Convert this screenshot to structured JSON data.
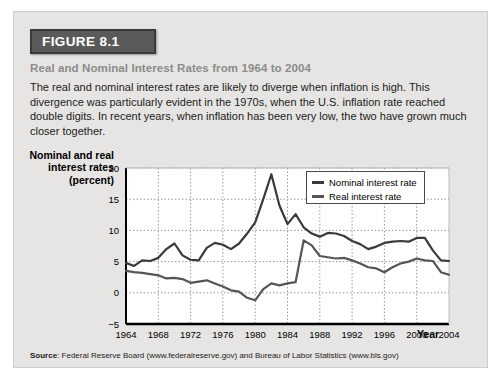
{
  "figure": {
    "badge": "FIGURE 8.1",
    "subtitle": "Real and Nominal Interest Rates from 1964 to 2004",
    "description": "The real and nominal interest rates are likely to diverge when inflation is high. This divergence was particularly evident in the 1970s, when the U.S. inflation rate reached double digits. In recent years, when inflation has been very low, the two have grown much closer together.",
    "source_label": "Source",
    "source_text": ": Federal Reserve Board (www.federalreserve.gov) and Bureau of Labor Statistics (www.bls.gov)"
  },
  "colors": {
    "panel_bg": "#e6e5e3",
    "badge_bg": "#5a5a5a",
    "subtitle": "#8b8b8b",
    "nominal_line": "#3a3a3a",
    "real_line": "#555555",
    "grid": "#9a9a9a"
  },
  "legend": {
    "position": "top-right-inside",
    "items": [
      {
        "label": "Nominal interest rate",
        "color": "#3a3a3a"
      },
      {
        "label": "Real interest rate",
        "color": "#555555"
      }
    ]
  },
  "chart_data": {
    "type": "line",
    "title": "Real and Nominal Interest Rates from 1964 to 2004",
    "xlabel": "Year",
    "ylabel": "Nominal and real interest rates (percent)",
    "xlim": [
      1964,
      2004
    ],
    "ylim": [
      -5,
      20
    ],
    "yticks": [
      -5,
      0,
      5,
      10,
      15,
      20
    ],
    "ytick_labels": [
      "−5",
      "0",
      "5",
      "10",
      "15",
      "20"
    ],
    "xticks": [
      1964,
      1968,
      1972,
      1976,
      1980,
      1984,
      1988,
      1992,
      1996,
      2000,
      2004
    ],
    "xtick_labels": [
      "1964",
      "1968",
      "1972",
      "1976",
      "1980",
      "1984",
      "1988",
      "1992",
      "1996",
      "2000",
      "2004"
    ],
    "grid": true,
    "x": [
      1964,
      1965,
      1966,
      1967,
      1968,
      1969,
      1970,
      1971,
      1972,
      1973,
      1974,
      1975,
      1976,
      1977,
      1978,
      1979,
      1980,
      1981,
      1982,
      1983,
      1984,
      1985,
      1986,
      1987,
      1988,
      1989,
      1990,
      1991,
      1992,
      1993,
      1994,
      1995,
      1996,
      1997,
      1998,
      1999,
      2000,
      2001,
      2002,
      2003,
      2004
    ],
    "series": [
      {
        "name": "Nominal interest rate",
        "color": "#3a3a3a",
        "values": [
          4.8,
          4.3,
          5.2,
          5.1,
          5.6,
          7.0,
          7.9,
          6.0,
          5.3,
          5.2,
          7.2,
          8.0,
          7.7,
          7.0,
          7.9,
          9.5,
          11.3,
          15.0,
          19.0,
          14.0,
          11.0,
          12.6,
          10.5,
          9.5,
          9.0,
          9.6,
          9.5,
          9.1,
          8.3,
          7.8,
          7.0,
          7.4,
          8.0,
          8.2,
          8.3,
          8.2,
          8.8,
          8.8,
          6.8,
          5.2,
          5.1
        ]
      },
      {
        "name": "Real interest rate",
        "color": "#555555",
        "values": [
          3.5,
          3.3,
          3.2,
          3.0,
          2.8,
          2.3,
          2.4,
          2.2,
          1.6,
          1.8,
          2.0,
          1.5,
          1.0,
          0.4,
          0.2,
          -0.8,
          -1.2,
          0.6,
          1.5,
          1.2,
          1.5,
          1.7,
          8.4,
          7.6,
          5.9,
          5.7,
          5.5,
          5.6,
          5.2,
          4.7,
          4.1,
          3.9,
          3.3,
          4.1,
          4.7,
          5.0,
          5.5,
          5.2,
          5.1,
          3.3,
          2.9
        ]
      }
    ]
  }
}
